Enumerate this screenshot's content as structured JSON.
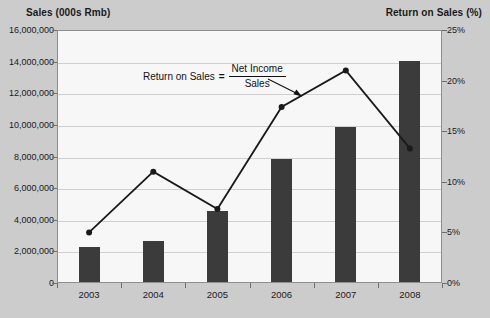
{
  "axis_titles": {
    "left": "Sales (000s Rmb)",
    "right": "Return on Sales (%)"
  },
  "annotation": {
    "label": "Return on Sales",
    "equals": "=",
    "numerator": "Net Income",
    "denominator": "Sales"
  },
  "colors": {
    "background": "#cccccc",
    "plot_background": "#f7f7f7",
    "bar": "#3b3b3b",
    "line": "#1a1a1a",
    "gridline": "#cfcfcf",
    "frame": "#8e8e8e",
    "text": "#1a1a1a"
  },
  "chart_data": {
    "type": "bar",
    "title": "",
    "xlabel": "",
    "ylabel": "Sales (000s Rmb)",
    "categories": [
      "2003",
      "2004",
      "2005",
      "2006",
      "2007",
      "2008"
    ],
    "grid": true,
    "legend": "none",
    "y_left": {
      "label": "Sales (000s Rmb)",
      "ticks": [
        "0",
        "2,000,000",
        "4,000,000",
        "6,000,000",
        "8,000,000",
        "10,000,000",
        "12,000,000",
        "14,000,000",
        "16,000,000"
      ],
      "tick_values": [
        0,
        2000000,
        4000000,
        6000000,
        8000000,
        10000000,
        12000000,
        14000000,
        16000000
      ],
      "ylim": [
        0,
        16000000
      ]
    },
    "y_right": {
      "label": "Return on Sales (%)",
      "ticks": [
        "0%",
        "5%",
        "10%",
        "15%",
        "20%",
        "25%"
      ],
      "tick_values": [
        0,
        5,
        10,
        15,
        20,
        25
      ],
      "ylim": [
        0,
        25
      ]
    },
    "series": [
      {
        "name": "Sales (000s Rmb)",
        "type": "bar",
        "axis": "left",
        "values": [
          2200000,
          2600000,
          4500000,
          7800000,
          9800000,
          14000000
        ]
      },
      {
        "name": "Return on Sales (%)",
        "type": "line",
        "axis": "right",
        "values": [
          5.0,
          11.0,
          7.3,
          17.4,
          21.0,
          13.3
        ]
      }
    ]
  }
}
